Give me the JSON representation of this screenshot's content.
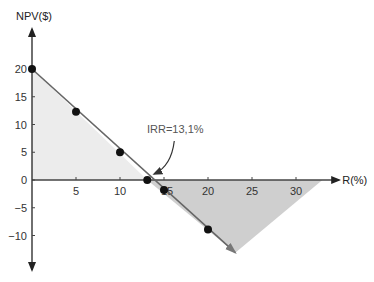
{
  "chart_data": {
    "type": "line",
    "title": "",
    "xlabel": "R(%)",
    "ylabel": "NPV($)",
    "xlim": [
      0,
      34
    ],
    "ylim": [
      -15,
      25
    ],
    "x_ticks": [
      5,
      10,
      15,
      20,
      25,
      30
    ],
    "y_ticks": [
      -10,
      -5,
      0,
      5,
      10,
      15,
      20
    ],
    "grid": false,
    "legend": "none",
    "series": [
      {
        "name": "NPV profile",
        "points": [
          {
            "x": 0,
            "y": 20
          },
          {
            "x": 5,
            "y": 12.3
          },
          {
            "x": 10,
            "y": 5
          },
          {
            "x": 13.1,
            "y": 0
          },
          {
            "x": 15,
            "y": -1.8
          },
          {
            "x": 20,
            "y": -8.9
          }
        ],
        "line_end": {
          "x": 23.1,
          "y": -13.1
        },
        "color": "#666666"
      }
    ],
    "shaded_regions": [
      {
        "name": "positive-npv-area",
        "vertices": [
          [
            0,
            20
          ],
          [
            0,
            0
          ],
          [
            13.1,
            0
          ]
        ],
        "color": "#ececec"
      },
      {
        "name": "negative-npv-area",
        "vertices": [
          [
            13.1,
            0
          ],
          [
            33,
            0
          ],
          [
            23.1,
            -13.1
          ]
        ],
        "color": "#cfcfcf"
      }
    ],
    "annotations": [
      {
        "text": "IRR=13,1%",
        "target": {
          "x": 13.1,
          "y": 0
        }
      }
    ]
  }
}
